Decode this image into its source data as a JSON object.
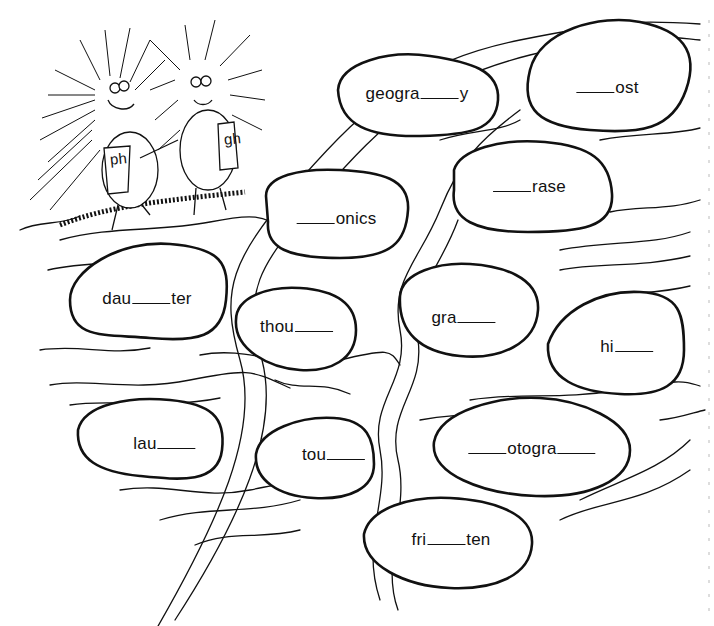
{
  "worksheet": {
    "title": "",
    "characters": [
      {
        "name": "porcupine-ph",
        "vest_label": "ph"
      },
      {
        "name": "porcupine-gh",
        "vest_label": "gh"
      }
    ],
    "stones": [
      {
        "id": "geography",
        "parts": [
          "geogra",
          "_",
          "y"
        ],
        "x": 417,
        "y": 94
      },
      {
        "id": "ghost",
        "parts": [
          "_",
          "ost"
        ],
        "x": 607,
        "y": 88
      },
      {
        "id": "phonics",
        "parts": [
          "_",
          "onics"
        ],
        "x": 336,
        "y": 219
      },
      {
        "id": "phrase",
        "parts": [
          "_",
          "rase"
        ],
        "x": 529,
        "y": 187
      },
      {
        "id": "daughter",
        "parts": [
          "dau",
          "_",
          "ter"
        ],
        "x": 147,
        "y": 299
      },
      {
        "id": "thought",
        "parts": [
          "thou",
          "_"
        ],
        "x": 297,
        "y": 327
      },
      {
        "id": "graph",
        "parts": [
          "gra",
          "_"
        ],
        "x": 464,
        "y": 318
      },
      {
        "id": "high",
        "parts": [
          "hi",
          "_"
        ],
        "x": 627,
        "y": 347
      },
      {
        "id": "laugh",
        "parts": [
          "lau",
          "_"
        ],
        "x": 165,
        "y": 444
      },
      {
        "id": "tough",
        "parts": [
          "tou",
          "_"
        ],
        "x": 334,
        "y": 455
      },
      {
        "id": "photograph",
        "parts": [
          "_",
          "otogra",
          "_"
        ],
        "x": 532,
        "y": 449
      },
      {
        "id": "frighten",
        "parts": [
          "fri",
          "_",
          "ten"
        ],
        "x": 451,
        "y": 540
      }
    ]
  }
}
